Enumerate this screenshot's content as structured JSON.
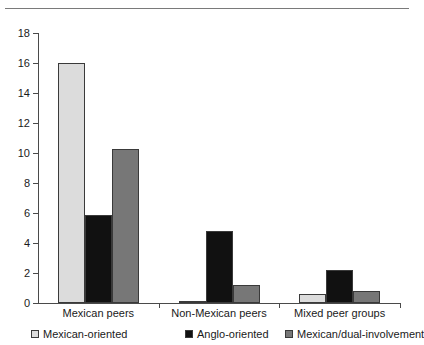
{
  "chart_data": {
    "type": "bar",
    "title": "",
    "subtitle": "",
    "xlabel": "",
    "ylabel": "",
    "ylim": [
      0,
      18
    ],
    "ytick_step": 2,
    "yticks": [
      "18",
      "16",
      "14",
      "12",
      "10",
      "8",
      "6",
      "4",
      "2",
      "0"
    ],
    "grid": false,
    "legend_position": "bottom",
    "categories": [
      "Mexican peers",
      "Non-Mexican peers",
      "Mixed peer groups"
    ],
    "series": [
      {
        "name": "Mexican-oriented",
        "color": "#dcdcdc",
        "values": [
          16.0,
          0.15,
          0.6
        ]
      },
      {
        "name": "Anglo-oriented",
        "color": "#111111",
        "values": [
          5.9,
          4.8,
          2.2
        ]
      },
      {
        "name": "Mexican/dual-involvement",
        "color": "#777777",
        "values": [
          10.3,
          1.2,
          0.8
        ]
      }
    ]
  },
  "legend": {
    "items": [
      {
        "label": "Mexican-oriented",
        "color": "#dcdcdc"
      },
      {
        "label": "Anglo-oriented",
        "color": "#111111"
      },
      {
        "label": "Mexican/dual-involvement",
        "color": "#777777"
      }
    ]
  },
  "axis": {
    "y_labels": [
      "18",
      "16",
      "14",
      "12",
      "10",
      "8",
      "6",
      "4",
      "2",
      "0"
    ],
    "x_labels": [
      "Mexican peers",
      "Non-Mexican peers",
      "Mixed peer groups"
    ]
  }
}
